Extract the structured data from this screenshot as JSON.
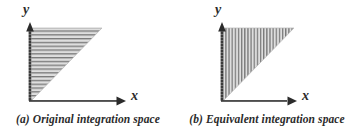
{
  "figure": {
    "background_color": "#ffffff",
    "ink_color": "#2b2b2b",
    "hatch_color": "#8a8a8a",
    "fill_color": "#d9d9d9",
    "panels": [
      {
        "id": "a",
        "caption": "(a) Original integration space",
        "caption_prefix": "(a)",
        "caption_text": "Original integration space",
        "axes": {
          "y_label": "y",
          "x_label": "x",
          "origin": [
            30,
            101
          ],
          "y_axis_top": [
            30,
            24
          ],
          "x_axis_right": [
            126,
            101
          ]
        },
        "region": {
          "shape": "triangle",
          "description": "right triangle with right angle at upper-left, hypotenuse from origin to upper-right",
          "vertices": [
            [
              30,
              28
            ],
            [
              102,
              28
            ],
            [
              30,
              101
            ]
          ],
          "hatch": {
            "orientation": "horizontal",
            "line_count": 19,
            "spacing": 3.8,
            "color": "#7d7d7d"
          }
        }
      },
      {
        "id": "b",
        "caption": "(b) Equivalent integration space",
        "caption_prefix": "(b)",
        "caption_text": "Equivalent integration space",
        "axes": {
          "y_label": "y",
          "x_label": "x",
          "origin": [
            44,
            101
          ],
          "y_axis_top": [
            44,
            24
          ],
          "x_axis_right": [
            119,
            101
          ]
        },
        "region": {
          "shape": "triangle",
          "description": "right triangle with right angle at upper-left, hypotenuse from origin to upper-right",
          "vertices": [
            [
              44,
              28
            ],
            [
              116,
              28
            ],
            [
              44,
              101
            ]
          ],
          "hatch": {
            "orientation": "vertical",
            "line_count": 23,
            "spacing": 3.1,
            "color": "#7d7d7d"
          }
        }
      }
    ]
  }
}
